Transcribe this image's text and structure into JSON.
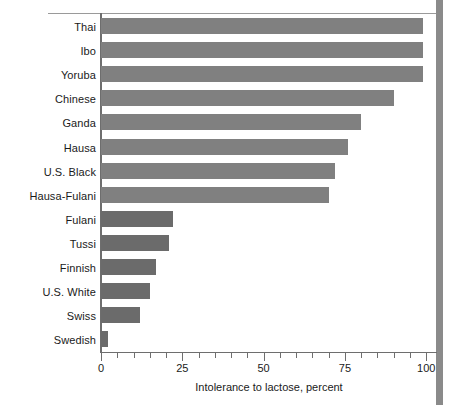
{
  "chart_data": {
    "type": "bar",
    "orientation": "horizontal",
    "title": "",
    "xlabel": "Intolerance to lactose, percent",
    "ylabel": "",
    "xlim": [
      0,
      103
    ],
    "ylim": null,
    "grid": false,
    "legend": null,
    "tick_step_minor": 5,
    "xticks": [
      0,
      25,
      50,
      75,
      100
    ],
    "xtick_labels": [
      "0",
      "25",
      "50",
      "75",
      "100"
    ],
    "categories": [
      "Thai",
      "Ibo",
      "Yoruba",
      "Chinese",
      "Ganda",
      "Hausa",
      "U.S. Black",
      "Hausa-Fulani",
      "Fulani",
      "Tussi",
      "Finnish",
      "U.S. White",
      "Swiss",
      "Swedish"
    ],
    "values": [
      99,
      99,
      99,
      90,
      80,
      76,
      72,
      70,
      22,
      21,
      17,
      15,
      12,
      2
    ],
    "bar_colors": [
      "#808080",
      "#808080",
      "#808080",
      "#808080",
      "#808080",
      "#808080",
      "#808080",
      "#808080",
      "#6b6b6b",
      "#6b6b6b",
      "#6b6b6b",
      "#6b6b6b",
      "#6b6b6b",
      "#6b6b6b"
    ]
  },
  "colors": {
    "bar_light": "#808080",
    "bar_dark": "#6b6b6b",
    "axis": "#6e6e6e",
    "rule": "#9a9a9a",
    "right_band": "#8a8a8a",
    "text": "#1a1a1a",
    "background": "#ffffff"
  }
}
